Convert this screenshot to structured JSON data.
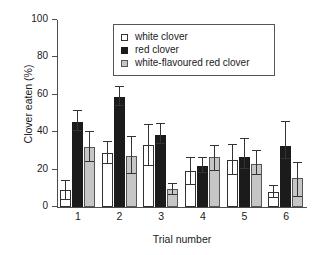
{
  "chart_data": {
    "type": "bar",
    "title": "",
    "xlabel": "Trial number",
    "ylabel": "Clover eaten (%)",
    "categories": [
      "1",
      "2",
      "3",
      "4",
      "5",
      "6"
    ],
    "ylim": [
      0,
      100
    ],
    "yticks": [
      0,
      20,
      40,
      60,
      80,
      100
    ],
    "ytick_labels": [
      "0",
      "20",
      "40",
      "60",
      "80",
      "100"
    ],
    "grid": false,
    "legend_position": "top-center",
    "series": [
      {
        "name": "white clover",
        "color": "#ffffff",
        "values": [
          9,
          29,
          33,
          19,
          25,
          8
        ],
        "errors_low": [
          5,
          6,
          11,
          7,
          8,
          3
        ],
        "errors_high": [
          5,
          6,
          11,
          7,
          8,
          3
        ]
      },
      {
        "name": "red clover",
        "color": "#1b1b1b",
        "values": [
          45.5,
          59,
          38.5,
          22,
          26.5,
          32.5
        ],
        "errors_low": [
          5,
          5,
          5,
          4,
          6,
          7
        ],
        "errors_high": [
          6,
          5,
          6,
          4,
          10,
          13
        ]
      },
      {
        "name": "white-flavoured red clover",
        "color": "#c6c6c6",
        "values": [
          32,
          27.5,
          9.5,
          26.5,
          23,
          15.5
        ],
        "errors_low": [
          8,
          10,
          3,
          7,
          6,
          10
        ],
        "errors_high": [
          8,
          10,
          3,
          6,
          7,
          8
        ]
      }
    ]
  },
  "legend": {
    "items": [
      {
        "label": "white clover",
        "swatch": "white"
      },
      {
        "label": "red clover",
        "swatch": "black"
      },
      {
        "label": "white-flavoured red clover",
        "swatch": "grey"
      }
    ]
  }
}
